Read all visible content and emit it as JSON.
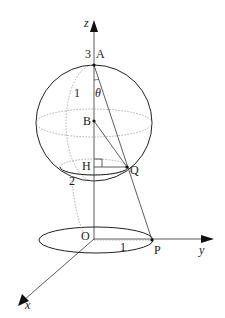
{
  "diagram": {
    "axes": {
      "z": "z",
      "y": "y",
      "x": "x"
    },
    "points": {
      "A": "A",
      "B": "B",
      "H": "H",
      "Q": "Q",
      "O": "O",
      "P": "P"
    },
    "angle": "θ",
    "numbers": {
      "height_A": "3",
      "radius_sphere": "1",
      "height_H": "2",
      "radius_base": "1"
    },
    "colors": {
      "stroke": "#222222",
      "dotted": "#999999"
    }
  }
}
